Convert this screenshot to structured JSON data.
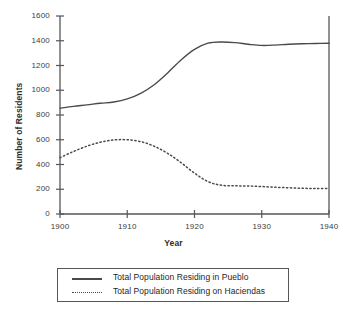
{
  "chart_data": {
    "type": "line",
    "title": "",
    "xlabel": "Year",
    "ylabel": "Number of Residents",
    "xlim": [
      1900,
      1940
    ],
    "ylim": [
      0,
      1600
    ],
    "xticks": [
      1900,
      1910,
      1920,
      1930,
      1940
    ],
    "yticks": [
      0,
      200,
      400,
      600,
      800,
      1000,
      1200,
      1400,
      1600
    ],
    "grid": false,
    "legend_position": "below-plot",
    "series": [
      {
        "name": "Total Population Residing in Pueblo",
        "style": "solid",
        "color": "#4a4a4a",
        "x": [
          1900,
          1902,
          1904,
          1906,
          1908,
          1910,
          1912,
          1914,
          1916,
          1918,
          1920,
          1922,
          1924,
          1926,
          1928,
          1930,
          1932,
          1934,
          1936,
          1938,
          1940
        ],
        "values": [
          855,
          870,
          882,
          895,
          905,
          930,
          975,
          1045,
          1140,
          1245,
          1330,
          1380,
          1390,
          1385,
          1372,
          1362,
          1365,
          1372,
          1376,
          1378,
          1380
        ]
      },
      {
        "name": "Total Population Residing on Haciendas",
        "style": "dotted",
        "color": "#4a4a4a",
        "x": [
          1900,
          1902,
          1904,
          1906,
          1908,
          1910,
          1912,
          1914,
          1916,
          1918,
          1920,
          1922,
          1924,
          1926,
          1928,
          1930,
          1932,
          1934,
          1936,
          1938,
          1940
        ],
        "values": [
          455,
          505,
          548,
          580,
          598,
          600,
          585,
          548,
          490,
          415,
          330,
          262,
          232,
          228,
          226,
          222,
          216,
          212,
          208,
          206,
          205
        ]
      }
    ]
  },
  "axes": {
    "ylabel": "Number of Residents",
    "xlabel": "Year",
    "ytick_labels": [
      "1600",
      "1400",
      "1200",
      "1000",
      "800",
      "600",
      "400",
      "200",
      "0"
    ],
    "xtick_labels": [
      "1900",
      "1910",
      "1920",
      "1930",
      "1940"
    ]
  },
  "legend": {
    "entries": [
      {
        "label": "Total Population Residing in Pueblo",
        "style": "solid"
      },
      {
        "label": "Total Population Residing on Haciendas",
        "style": "dotted"
      }
    ]
  }
}
